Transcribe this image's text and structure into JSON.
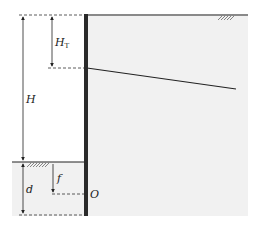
{
  "diagram": {
    "labels": {
      "H_T": "H",
      "H_T_sub": "T",
      "H": "H",
      "d": "d",
      "f": "f",
      "O": "O"
    },
    "colors": {
      "line": "#222222",
      "wall": "#2a2a2a",
      "soil_fill": "#f0f0f0",
      "background": "#ffffff"
    }
  }
}
